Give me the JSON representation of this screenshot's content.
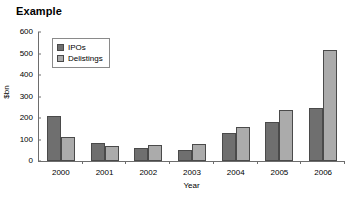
{
  "chart_data": {
    "type": "bar",
    "title": "Example",
    "xlabel": "Year",
    "ylabel": "$bn",
    "categories": [
      "2000",
      "2001",
      "2002",
      "2003",
      "2004",
      "2005",
      "2006"
    ],
    "series": [
      {
        "name": "IPOs",
        "color": "#6f6f6f",
        "values": [
          210,
          82,
          60,
          49,
          128,
          180,
          248
        ]
      },
      {
        "name": "Delistings",
        "color": "#ababab",
        "values": [
          110,
          70,
          75,
          80,
          158,
          237,
          517
        ]
      }
    ],
    "ylim": [
      0,
      600
    ],
    "yticks": [
      0,
      100,
      200,
      300,
      400,
      500,
      600
    ],
    "grid": false,
    "legend_position": "top-left",
    "axis_color": "#6d6d6d",
    "bar_border_color": "#4a4a4a"
  }
}
